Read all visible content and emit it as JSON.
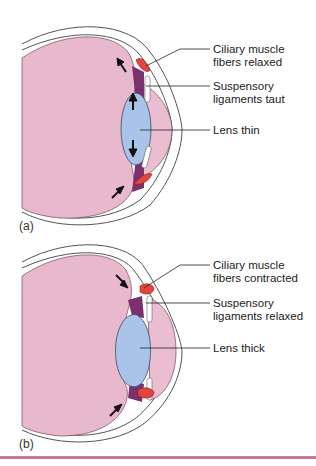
{
  "colors": {
    "vitreous": "#e8b8cc",
    "lens": "#a9c4e8",
    "ciliary_muscle": "#e2453d",
    "suspensory_ligaments": "#7a2f6e",
    "sclera_outline": "#555555",
    "bottom_rule": "#c77a93"
  },
  "panels": [
    {
      "id": "a",
      "panel_label": "(a)",
      "labels": {
        "ciliary_line1": "Ciliary muscle",
        "ciliary_line2": "fibers relaxed",
        "suspensory_line1": "Suspensory",
        "suspensory_line2": "ligaments taut",
        "lens": "Lens thin"
      }
    },
    {
      "id": "b",
      "panel_label": "(b)",
      "labels": {
        "ciliary_line1": "Ciliary muscle",
        "ciliary_line2": "fibers contracted",
        "suspensory_line1": "Suspensory",
        "suspensory_line2": "ligaments relaxed",
        "lens": "Lens thick"
      }
    }
  ]
}
